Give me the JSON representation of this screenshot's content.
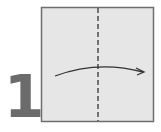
{
  "step": {
    "number": "1"
  },
  "paper": {
    "fill": "#e6e6e6",
    "border": "#6e6e6e"
  },
  "fold_line": {
    "type": "valley-fold-dashed",
    "color": "#555555"
  },
  "arrow": {
    "direction": "left-to-right",
    "color": "#333333"
  },
  "colors": {
    "number": "#6b6b6b"
  }
}
